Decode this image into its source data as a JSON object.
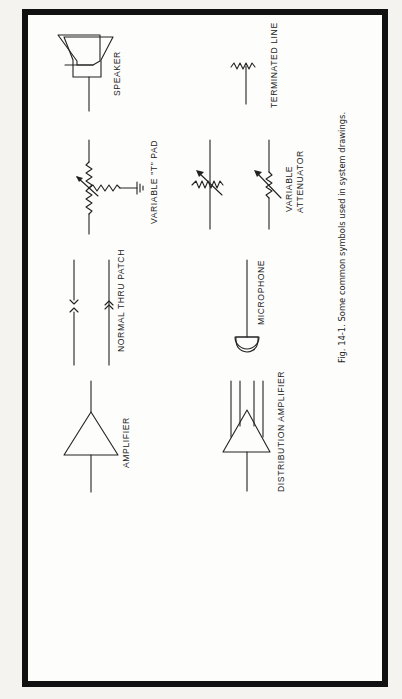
{
  "figure": {
    "caption": "Fig. 14-1. Some common symbols used in system drawings.",
    "orientation": "rotated 90° counter-clockwise",
    "symbols": [
      {
        "id": "speaker",
        "label": "SPEAKER"
      },
      {
        "id": "variable-t-pad",
        "label": "VARIABLE \"T\" PAD"
      },
      {
        "id": "normal-thru-patch",
        "label": "NORMAL THRU PATCH"
      },
      {
        "id": "amplifier",
        "label": "AMPLIFIER"
      },
      {
        "id": "terminated-line",
        "label": "TERMINATED LINE"
      },
      {
        "id": "variable-attenuator",
        "label_line1": "VARIABLE",
        "label_line2": "ATTENUATOR"
      },
      {
        "id": "microphone",
        "label": "MICROPHONE"
      },
      {
        "id": "distribution-amplifier",
        "label": "DISTRIBUTION AMPLIFIER"
      }
    ]
  },
  "colors": {
    "frame": "#111111",
    "paper": "#fdfdfb",
    "ink": "#222222"
  }
}
